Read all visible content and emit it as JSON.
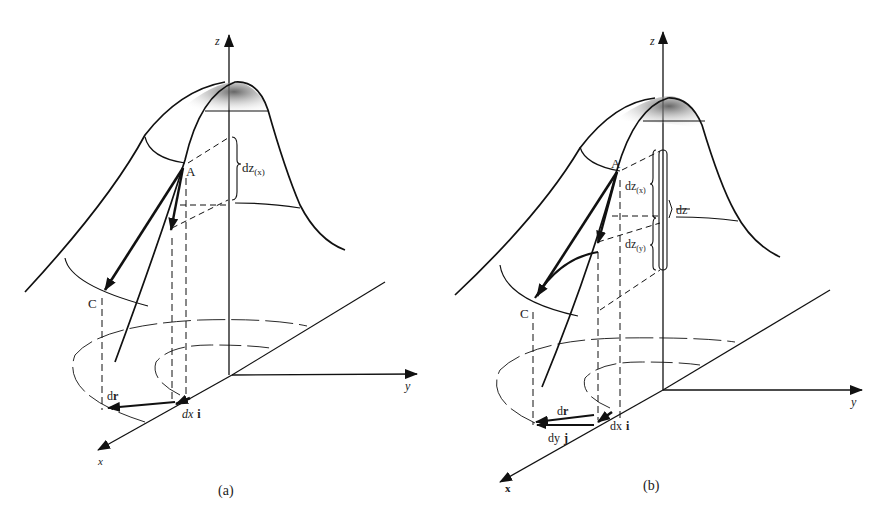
{
  "figure": {
    "panels": [
      {
        "id": "a",
        "caption": "(a)",
        "axes": {
          "x": "x",
          "y": "y",
          "z": "z"
        },
        "points": [
          "A",
          "C"
        ],
        "labels": {
          "dz_x": "dz",
          "dz_x_sub": "(x)",
          "dr": "dr",
          "dx_i_a": "dx",
          "dx_i_b": "i"
        }
      },
      {
        "id": "b",
        "caption": "(b)",
        "axes": {
          "x": "x",
          "y": "y",
          "z": "z"
        },
        "points": [
          "A",
          "C"
        ],
        "labels": {
          "dz_x": "dz",
          "dz_x_sub": "(x)",
          "dz_y": "dz",
          "dz_y_sub": "(y)",
          "dz": "dz",
          "dr": "dr",
          "dx_i_a": "dx",
          "dx_i_b": "i",
          "dy_j_a": "dy",
          "dy_j_b": "j"
        }
      }
    ]
  }
}
